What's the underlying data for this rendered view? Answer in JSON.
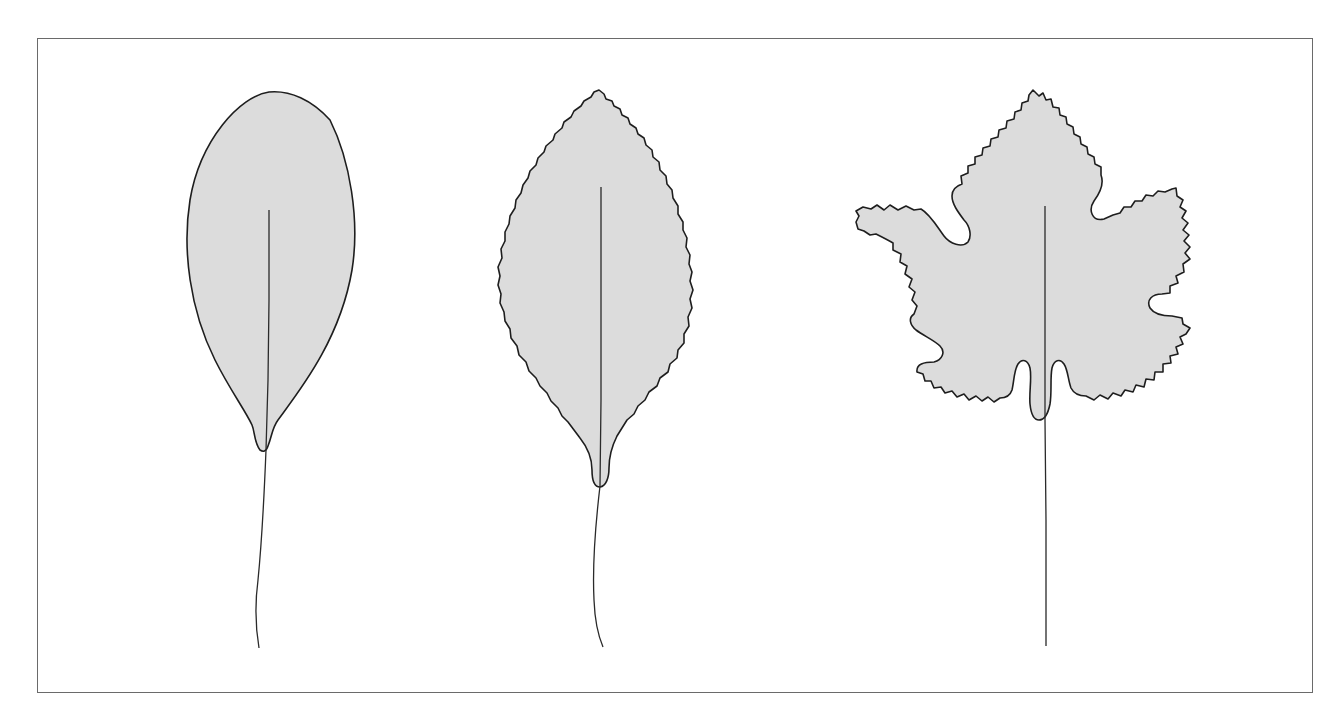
{
  "figure": {
    "description": "Three leaf outlines illustrating leaf margin types",
    "colors": {
      "background": "#ffffff",
      "frame": "#6a6a6a",
      "leaf_fill": "#dcdcdc",
      "outline": "#1e1e1e"
    },
    "leaves": [
      {
        "id": "leaf-1",
        "margin_type": "entire (smooth)",
        "shape": "elliptic"
      },
      {
        "id": "leaf-2",
        "margin_type": "serrate",
        "shape": "ovate-elliptic"
      },
      {
        "id": "leaf-3",
        "margin_type": "serrate, palmately lobed",
        "shape": "lobed"
      }
    ]
  }
}
